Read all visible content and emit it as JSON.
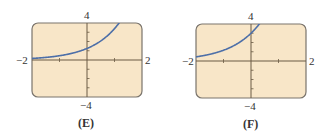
{
  "chart_data": [
    {
      "type": "line",
      "title": "",
      "caption": "(E)",
      "xlabel": "",
      "ylabel": "",
      "xlim": [
        -2,
        2
      ],
      "ylim": [
        -4,
        4
      ],
      "x_tick_labels": {
        "min": "−2",
        "max": "2"
      },
      "y_tick_labels": {
        "max": "4",
        "min": "−4"
      },
      "grid": false,
      "series": [
        {
          "name": "curve",
          "function": "exponential growth",
          "x": [
            -2,
            -1.5,
            -1,
            -0.5,
            0,
            0.5,
            1,
            1.16
          ],
          "y": [
            0.17,
            0.28,
            0.46,
            0.76,
            1.25,
            2.06,
            3.4,
            4.0
          ]
        }
      ],
      "colors": {
        "background": "#f8e6c8",
        "curve": "#4d6fa8",
        "frame": "#7a746c",
        "axis": "#6b5a44"
      }
    },
    {
      "type": "line",
      "title": "",
      "caption": "(F)",
      "xlabel": "",
      "ylabel": "",
      "xlim": [
        -2,
        2
      ],
      "ylim": [
        -4,
        4
      ],
      "x_tick_labels": {
        "min": "−2",
        "max": "2"
      },
      "y_tick_labels": {
        "max": "4",
        "min": "−4"
      },
      "grid": false,
      "series": [
        {
          "name": "curve",
          "function": "exponential growth",
          "x": [
            -2,
            -1.5,
            -1,
            -0.5,
            0,
            0.3
          ],
          "y": [
            0.45,
            0.72,
            1.16,
            1.87,
            3.0,
            4.0
          ]
        }
      ],
      "colors": {
        "background": "#f8e6c8",
        "curve": "#4d6fa8",
        "frame": "#7a746c",
        "axis": "#6b5a44"
      }
    }
  ]
}
